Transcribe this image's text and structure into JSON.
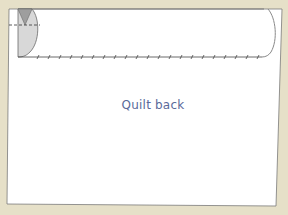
{
  "diagram": {
    "label": "Quilt back",
    "colors": {
      "background": "#e6e0c8",
      "sheet": "#ffffff",
      "outline": "#6a6a6a",
      "roll_fill": "#d6d6d6",
      "roll_dark": "#9a9a9a",
      "label": "#5a6a9a"
    },
    "elements": [
      "quilt-back-sheet",
      "rolled-edge",
      "fold-dashed-line",
      "basting-stitch-line"
    ]
  }
}
